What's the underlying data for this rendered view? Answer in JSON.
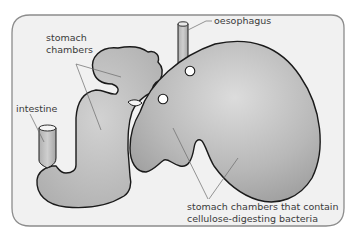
{
  "diagram": {
    "labels": {
      "oesophagus": "oesophagus",
      "stomach_chambers_line1": "stomach",
      "stomach_chambers_line2": "chambers",
      "intestine": "intestine",
      "bacteria_chambers_line1": "stomach chambers that contain",
      "bacteria_chambers_line2": "cellulose-digesting bacteria"
    },
    "colors": {
      "panel_background": "#f2f2f2",
      "panel_border": "#8a8a8a",
      "organ_fill_light": "#d4d4d4",
      "organ_fill_dark": "#9e9e9e",
      "outline": "#1a1a1a",
      "leader_line": "#6a6a6a",
      "text": "#3a3a3a"
    }
  }
}
